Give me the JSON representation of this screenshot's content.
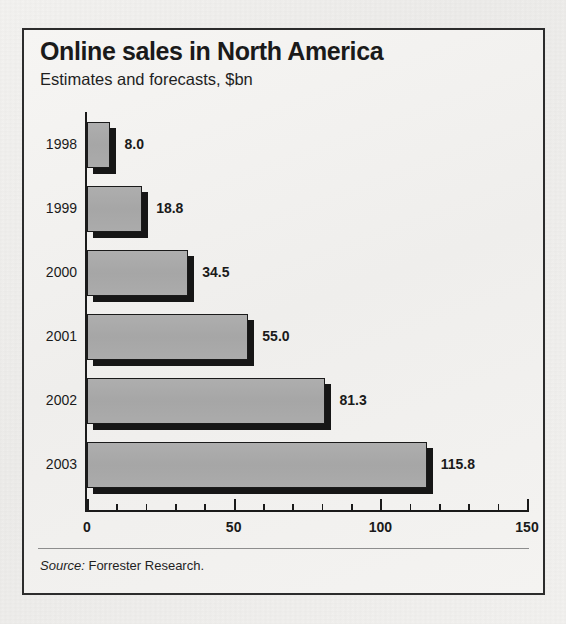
{
  "chart_data": {
    "type": "bar",
    "orientation": "horizontal",
    "title": "Online sales in North America",
    "subtitle": "Estimates and forecasts, $bn",
    "xlabel": "",
    "ylabel": "",
    "xlim": [
      0,
      150
    ],
    "grid": false,
    "legend": null,
    "categories": [
      "1998",
      "1999",
      "2000",
      "2001",
      "2002",
      "2003"
    ],
    "values": [
      8.0,
      18.8,
      34.5,
      55.0,
      81.3,
      115.8
    ],
    "value_labels": [
      "8.0",
      "18.8",
      "34.5",
      "55.0",
      "81.3",
      "115.8"
    ],
    "x_major_ticks": [
      0,
      50,
      100,
      150
    ],
    "x_major_tick_labels": [
      "0",
      "50",
      "100",
      "150"
    ],
    "x_minor_tick_interval": 10,
    "bar_color": "#a8a8a8",
    "bar_edge_color": "#1a1a1a",
    "shadow_color": "#161616",
    "source_prefix": "Source:",
    "source_text": "Forrester Research."
  },
  "frame": {
    "border_color": "#2c2c2c",
    "background": "#f2f1ef"
  }
}
